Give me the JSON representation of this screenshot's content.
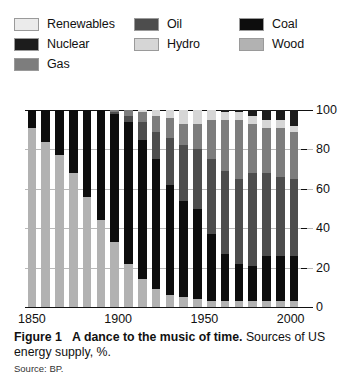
{
  "legend": {
    "rows": [
      [
        {
          "label": "Renewables",
          "key": "renewables",
          "color": "#ebebeb"
        },
        {
          "label": "Oil",
          "key": "oil",
          "color": "#4d4d4d"
        },
        {
          "label": "Coal",
          "key": "coal",
          "color": "#0d0d0d"
        }
      ],
      [
        {
          "label": "Nuclear",
          "key": "nuclear",
          "color": "#1c1c1c"
        },
        {
          "label": "Hydro",
          "key": "hydro",
          "color": "#d6d6d6"
        },
        {
          "label": "Wood",
          "key": "wood",
          "color": "#b2b2b2"
        }
      ],
      [
        {
          "label": "Gas",
          "key": "gas",
          "color": "#7d7d7d"
        }
      ]
    ]
  },
  "axis": {
    "y_ticks": [
      "0",
      "20",
      "40",
      "60",
      "80",
      "100"
    ],
    "y_values": [
      0,
      20,
      40,
      60,
      80,
      100
    ],
    "x_ticks": [
      "1850",
      "1900",
      "1950",
      "2000"
    ],
    "x_tick_values": [
      1850,
      1900,
      1950,
      2000
    ]
  },
  "caption": {
    "figure": "Figure 1",
    "title": "A dance to the music of time.",
    "rest": "Sources of US energy supply, %.",
    "source": "Source: BP."
  },
  "chart_data": {
    "type": "bar",
    "stacked": true,
    "stack_mode": "percent",
    "title": "A dance to the music of time.",
    "subtitle": "Sources of US energy supply, %.",
    "xlabel": "",
    "ylabel": "%",
    "ylim": [
      0,
      100
    ],
    "yticks": [
      0,
      20,
      40,
      60,
      80,
      100
    ],
    "grid": "horizontal",
    "legend_position": "top",
    "series_order": [
      "wood",
      "coal",
      "oil",
      "gas",
      "hydro",
      "nuclear",
      "renewables"
    ],
    "series_colors": {
      "renewables": "#ebebeb",
      "nuclear": "#1c1c1c",
      "gas": "#7d7d7d",
      "oil": "#4d4d4d",
      "hydro": "#d6d6d6",
      "coal": "#0d0d0d",
      "wood": "#b2b2b2"
    },
    "categories": [
      1850,
      1858,
      1866,
      1874,
      1882,
      1890,
      1898,
      1906,
      1914,
      1922,
      1930,
      1938,
      1946,
      1954,
      1962,
      1970,
      1978,
      1986,
      1994,
      2002
    ],
    "series": [
      {
        "name": "Wood",
        "key": "wood",
        "values": [
          91,
          84,
          77,
          68,
          56,
          44,
          33,
          22,
          14,
          9,
          6,
          5,
          4,
          3,
          3,
          3,
          3,
          3,
          3,
          3
        ]
      },
      {
        "name": "Coal",
        "key": "coal",
        "values": [
          9,
          16,
          23,
          32,
          44,
          56,
          65,
          72,
          71,
          66,
          56,
          49,
          46,
          34,
          24,
          19,
          18,
          23,
          23,
          23
        ]
      },
      {
        "name": "Oil",
        "key": "oil",
        "values": [
          0,
          0,
          0,
          0,
          0,
          0,
          1,
          3,
          9,
          14,
          24,
          28,
          30,
          38,
          42,
          43,
          47,
          42,
          40,
          39
        ]
      },
      {
        "name": "Gas",
        "key": "gas",
        "values": [
          0,
          0,
          0,
          0,
          0,
          0,
          1,
          3,
          5,
          8,
          10,
          11,
          13,
          20,
          26,
          30,
          25,
          23,
          25,
          24
        ]
      },
      {
        "name": "Hydro",
        "key": "hydro",
        "values": [
          0,
          0,
          0,
          0,
          0,
          0,
          0,
          0,
          1,
          3,
          4,
          7,
          7,
          5,
          4,
          4,
          4,
          4,
          4,
          3
        ]
      },
      {
        "name": "Nuclear",
        "key": "nuclear",
        "values": [
          0,
          0,
          0,
          0,
          0,
          0,
          0,
          0,
          0,
          0,
          0,
          0,
          0,
          0,
          1,
          1,
          3,
          5,
          5,
          8
        ]
      },
      {
        "name": "Renewables",
        "key": "renewables",
        "values": [
          0,
          0,
          0,
          0,
          0,
          0,
          0,
          0,
          0,
          0,
          0,
          0,
          0,
          0,
          0,
          0,
          0,
          0,
          0,
          0
        ]
      }
    ]
  }
}
